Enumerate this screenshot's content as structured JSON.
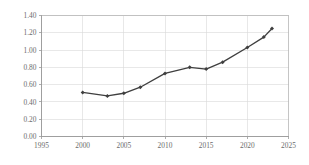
{
  "chart_data": {
    "type": "line",
    "title": "",
    "subtitle": "",
    "xlabel": "",
    "ylabel": "",
    "xlim": [
      1995,
      2025
    ],
    "ylim": [
      0.0,
      1.4
    ],
    "ytick_step": 0.2,
    "xtick_step": 5,
    "grid": "both",
    "legend": "none",
    "x": [
      2000,
      2003,
      2005,
      2007,
      2010,
      2013,
      2015,
      2017,
      2020,
      2022,
      2023
    ],
    "values": [
      0.51,
      0.47,
      0.5,
      0.57,
      0.73,
      0.8,
      0.78,
      0.86,
      1.03,
      1.15,
      1.25
    ],
    "series": [
      {
        "name": "",
        "x": [
          2000,
          2003,
          2005,
          2007,
          2010,
          2013,
          2015,
          2017,
          2020,
          2022,
          2023
        ],
        "values": [
          0.51,
          0.47,
          0.5,
          0.57,
          0.73,
          0.8,
          0.78,
          0.86,
          1.03,
          1.15,
          1.25
        ],
        "color": "#3f3f3f",
        "marker": "diamond"
      }
    ],
    "xticks": [
      1995,
      2000,
      2005,
      2010,
      2015,
      2020,
      2025
    ],
    "xtick_labels": [
      "1995",
      "2000",
      "2005",
      "2010",
      "2015",
      "2020",
      "2025"
    ],
    "yticks": [
      0.0,
      0.2,
      0.4,
      0.6,
      0.8,
      1.0,
      1.2,
      1.4
    ],
    "ytick_labels": [
      "0.00",
      "0.20",
      "0.40",
      "0.60",
      "0.80",
      "1.00",
      "1.20",
      "1.40"
    ],
    "annotations": []
  },
  "colors": {
    "series": "#3f3f3f",
    "gridline": "#d9d9d9",
    "axis": "#9a9a9a",
    "plot_border": "#b7b7b7",
    "tick_text": "#6b6b6b",
    "background": "#ffffff"
  }
}
